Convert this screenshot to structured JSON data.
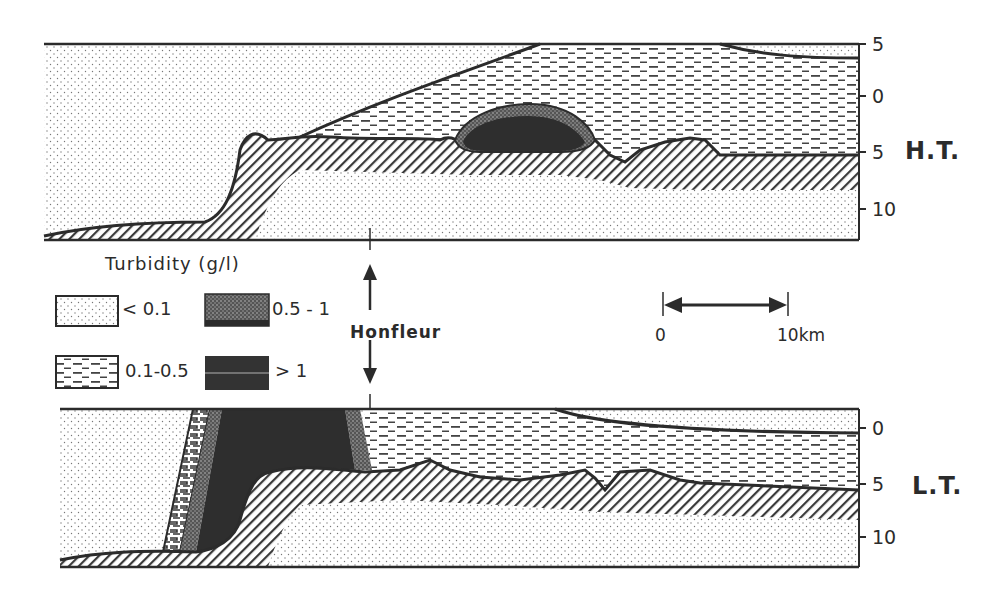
{
  "figure": {
    "type": "estuary longitudinal cross-sections of suspended sediment turbidity",
    "panels": [
      {
        "id": "high-tide",
        "label": "H.T.",
        "depth_axis": {
          "ticks": [
            "5",
            "0",
            "5",
            "10"
          ],
          "unit": "m (implied)"
        }
      },
      {
        "id": "low-tide",
        "label": "L.T.",
        "depth_axis": {
          "ticks": [
            "0",
            "5",
            "10"
          ],
          "unit": "m (implied)"
        }
      }
    ],
    "legend": {
      "title": "Turbidity (g/l)",
      "items": [
        {
          "label": "< 0.1",
          "pattern": "sparse-dots"
        },
        {
          "label": "0.5 - 1",
          "pattern": "dense-dots"
        },
        {
          "label": "0.1-0.5",
          "pattern": "dashes"
        },
        {
          "label": "> 1",
          "pattern": "solid-dark"
        }
      ]
    },
    "location_marker": {
      "label": "Honfleur"
    },
    "scale_bar": {
      "start": "0",
      "end": "10km"
    },
    "colors": {
      "ink": "#2b2b2b",
      "paper": "#ffffff",
      "dark_fill": "#333333"
    }
  }
}
